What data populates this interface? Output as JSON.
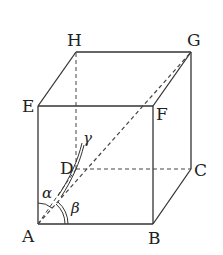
{
  "diagram": {
    "type": "cube",
    "vertices": {
      "A": {
        "label": "A",
        "x": 38,
        "y": 224
      },
      "B": {
        "label": "B",
        "x": 153,
        "y": 224
      },
      "C": {
        "label": "C",
        "x": 191,
        "y": 169
      },
      "D": {
        "label": "D",
        "x": 76,
        "y": 169
      },
      "E": {
        "label": "E",
        "x": 38,
        "y": 106
      },
      "F": {
        "label": "F",
        "x": 153,
        "y": 106
      },
      "G": {
        "label": "G",
        "x": 191,
        "y": 52
      },
      "H": {
        "label": "H",
        "x": 76,
        "y": 52
      }
    },
    "solid_edges": [
      "AB",
      "BC",
      "BF",
      "AE",
      "EF",
      "EH",
      "HG",
      "FG",
      "CG"
    ],
    "dashed_edges": [
      "AD",
      "DC",
      "DH",
      "AG"
    ],
    "angles": {
      "alpha": {
        "label": "α",
        "between": "AE-AG"
      },
      "beta": {
        "label": "β",
        "between": "AB-AG"
      },
      "gamma": {
        "label": "γ",
        "between": "AD-AG"
      }
    },
    "colors": {
      "line": "#333333",
      "background": "#ffffff"
    }
  }
}
